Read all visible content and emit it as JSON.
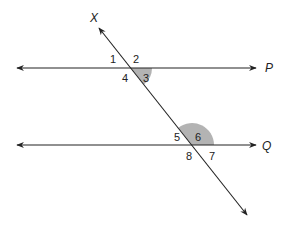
{
  "diagram": {
    "type": "parallel-lines-transversal",
    "colors": {
      "line": "#222222",
      "shade": "#b3b3b3",
      "background": "#ffffff"
    },
    "lines": {
      "P": {
        "label": "P",
        "y": 68,
        "x1": 17,
        "x2": 256
      },
      "Q": {
        "label": "Q",
        "y": 145,
        "x1": 17,
        "x2": 256
      },
      "transversal": {
        "label": "X",
        "x1": 99,
        "y1": 28,
        "x2": 247,
        "y2": 215
      }
    },
    "angles": [
      {
        "id": "1",
        "label": "1"
      },
      {
        "id": "2",
        "label": "2"
      },
      {
        "id": "3",
        "label": "3",
        "shaded": true
      },
      {
        "id": "4",
        "label": "4"
      },
      {
        "id": "5",
        "label": "5"
      },
      {
        "id": "6",
        "label": "6",
        "shaded": true
      },
      {
        "id": "7",
        "label": "7"
      },
      {
        "id": "8",
        "label": "8"
      }
    ]
  }
}
